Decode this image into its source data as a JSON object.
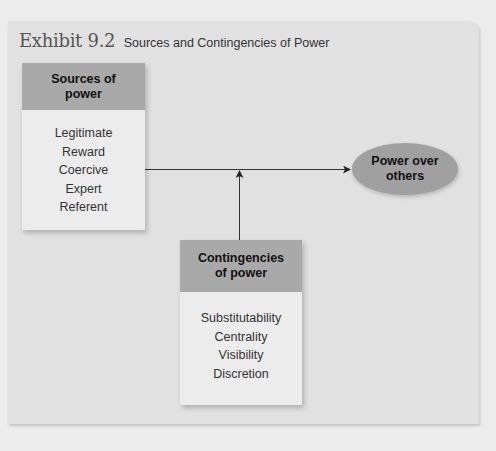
{
  "exhibit": {
    "number": "Exhibit 9.2",
    "title": "Sources and Contingencies of Power"
  },
  "sources": {
    "heading": "Sources of power",
    "items": [
      "Legitimate",
      "Reward",
      "Coercive",
      "Expert",
      "Referent"
    ]
  },
  "contingencies": {
    "heading": "Contingencies of power",
    "items": [
      "Substitutability",
      "Centrality",
      "Visibility",
      "Discretion"
    ]
  },
  "outcome": {
    "label": "Power over others"
  },
  "colors": {
    "panel": "#e1e1e1",
    "box_header": "#a9a9a9",
    "ellipse": "#a0a0a0",
    "line": "#333333"
  }
}
